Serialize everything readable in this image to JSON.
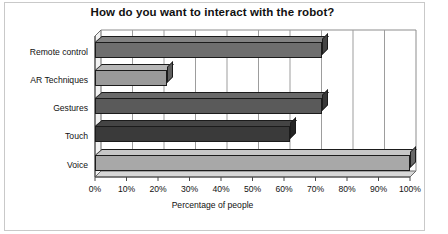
{
  "chart_data": {
    "type": "bar",
    "orientation": "horizontal",
    "title": "How do you want to interact with the robot?",
    "xlabel": "Percentage of people",
    "ylabel": "",
    "categories": [
      "Remote control",
      "AR Techniques",
      "Gestures",
      "Touch",
      "Voice"
    ],
    "values": [
      72,
      23,
      72,
      62,
      100
    ],
    "xlim": [
      0,
      100
    ],
    "xtick_labels": [
      "0%",
      "10%",
      "20%",
      "30%",
      "40%",
      "50%",
      "60%",
      "70%",
      "80%",
      "90%",
      "100%"
    ],
    "xtick_values": [
      0,
      10,
      20,
      30,
      40,
      50,
      60,
      70,
      80,
      90,
      100
    ],
    "grid": "vertical",
    "legend": "none",
    "style": "3d-bar-grayscale",
    "bar_colors": [
      "#6e6e6e",
      "#9a9a9a",
      "#5a5a5a",
      "#3a3a3a",
      "#a8a8a8"
    ],
    "series": [
      {
        "name": "Percentage of people",
        "points": [
          {
            "category": "Remote control",
            "value": 72
          },
          {
            "category": "AR Techniques",
            "value": 23
          },
          {
            "category": "Gestures",
            "value": 72
          },
          {
            "category": "Touch",
            "value": 62
          },
          {
            "category": "Voice",
            "value": 100
          }
        ]
      }
    ]
  },
  "colors": {
    "background": "#ffffff",
    "text": "#111111",
    "grid": "#9d9d9d",
    "axis": "#6b6b6b",
    "border": "#c9c9c9"
  }
}
